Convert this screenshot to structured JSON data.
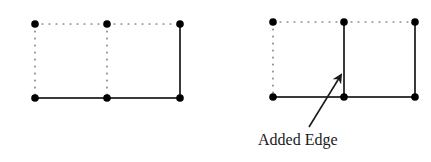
{
  "graphs": [
    {
      "name": "before",
      "nodes": [
        [
          35,
          24
        ],
        [
          107,
          24
        ],
        [
          180,
          24
        ],
        [
          35,
          98
        ],
        [
          107,
          98
        ],
        [
          180,
          98
        ]
      ],
      "solid_edges": [
        [
          3,
          4
        ],
        [
          4,
          5
        ],
        [
          2,
          5
        ]
      ],
      "dotted_edges": [
        [
          0,
          1
        ],
        [
          1,
          2
        ],
        [
          0,
          3
        ],
        [
          1,
          4
        ]
      ]
    },
    {
      "name": "after",
      "nodes": [
        [
          273,
          22
        ],
        [
          344,
          22
        ],
        [
          415,
          22
        ],
        [
          273,
          97
        ],
        [
          344,
          97
        ],
        [
          415,
          97
        ]
      ],
      "solid_edges": [
        [
          3,
          4
        ],
        [
          4,
          5
        ],
        [
          2,
          5
        ],
        [
          1,
          4
        ]
      ],
      "dotted_edges": [
        [
          0,
          1
        ],
        [
          1,
          2
        ],
        [
          0,
          3
        ]
      ]
    }
  ],
  "annotation": {
    "label": "Added Edge",
    "arrow_from": [
      309,
      127
    ],
    "arrow_to": [
      341,
      75
    ]
  },
  "colors": {
    "edge": "#3a3a3a",
    "node": "#000000",
    "dotted": "#555555"
  }
}
